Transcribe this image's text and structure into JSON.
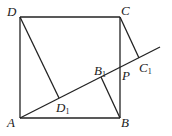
{
  "diagram": {
    "type": "geometry",
    "labels": {
      "A": "A",
      "B": "B",
      "C": "C",
      "D": "D",
      "D1": "D",
      "B1": "B",
      "C1": "C",
      "P": "P",
      "sub": "1"
    },
    "points": {
      "A": [
        20,
        118
      ],
      "B": [
        120,
        118
      ],
      "C": [
        120,
        17
      ],
      "D": [
        20,
        17
      ],
      "D1": [
        59,
        98
      ],
      "B1": [
        101,
        75
      ],
      "P": [
        120,
        68
      ],
      "C1": [
        139,
        58
      ],
      "L": [
        160,
        47
      ]
    }
  }
}
